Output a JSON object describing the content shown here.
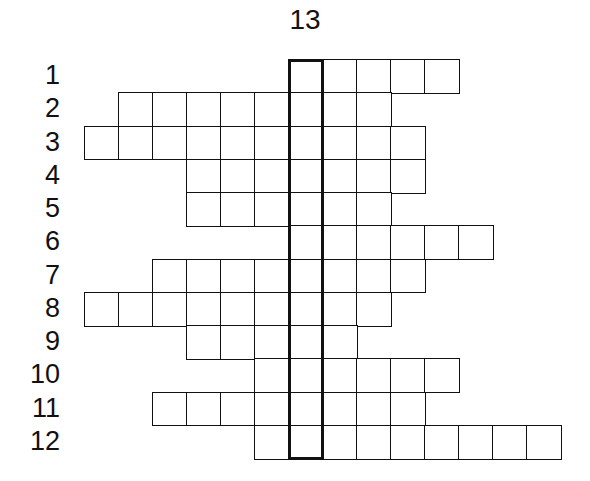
{
  "puzzle": {
    "title": "13",
    "grid": {
      "origin_x": 84,
      "origin_y": 59,
      "cell_w": 34,
      "cell_h": 33.25
    },
    "highlight_column": {
      "col": 6,
      "label": "13",
      "from_row": 1,
      "to_row": 12
    },
    "rows": [
      {
        "number": "1",
        "start_col": 6,
        "length": 5
      },
      {
        "number": "2",
        "start_col": 1,
        "length": 8
      },
      {
        "number": "3",
        "start_col": 0,
        "length": 10
      },
      {
        "number": "4",
        "start_col": 3,
        "length": 7
      },
      {
        "number": "5",
        "start_col": 3,
        "length": 6
      },
      {
        "number": "6",
        "start_col": 6,
        "length": 6
      },
      {
        "number": "7",
        "start_col": 2,
        "length": 8
      },
      {
        "number": "8",
        "start_col": 0,
        "length": 9
      },
      {
        "number": "9",
        "start_col": 3,
        "length": 5
      },
      {
        "number": "10",
        "start_col": 5,
        "length": 6
      },
      {
        "number": "11",
        "start_col": 2,
        "length": 8
      },
      {
        "number": "12",
        "start_col": 5,
        "length": 9
      }
    ]
  }
}
